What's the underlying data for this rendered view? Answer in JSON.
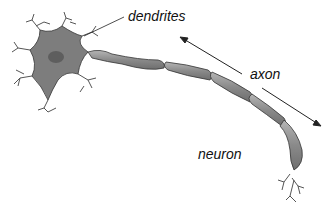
{
  "diagram": {
    "title": "neuron",
    "labels": {
      "dendrites": "dendrites",
      "axon": "axon",
      "neuron": "neuron"
    },
    "colors": {
      "cell_body": "#7a7a7a",
      "axon_segment": "#8c8c8c",
      "outline": "#333333",
      "nucleus": "#5e5e5e"
    }
  }
}
